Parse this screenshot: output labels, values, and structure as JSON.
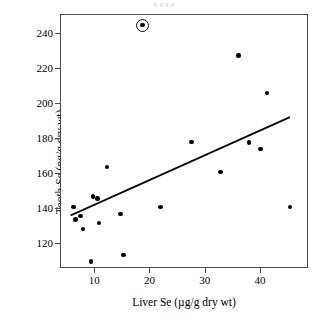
{
  "figure": {
    "top_caption_fragment": "p                          g       g  p",
    "background_color": "#ffffff",
    "frame_color": "#4a4a4a",
    "marker_color": "#000000",
    "line_color": "#000000"
  },
  "chart_data": {
    "type": "scatter",
    "title": "",
    "xlabel": "Liver Se (µg/g dry wt)",
    "ylabel": "Tooth Se (ng/g dry wt)",
    "xlim": [
      4.0,
      48.5
    ],
    "ylim": [
      106,
      250
    ],
    "xticks": [
      10,
      20,
      30,
      40
    ],
    "xtick_labels": [
      "10",
      "20",
      "30",
      "40"
    ],
    "yticks": [
      120,
      140,
      160,
      180,
      200,
      220,
      240
    ],
    "ytick_labels": [
      "120",
      "140",
      "160",
      "180",
      "200",
      "220",
      "240"
    ],
    "grid": false,
    "legend": null,
    "points": [
      {
        "x": 6.3,
        "y": 140.4
      },
      {
        "x": 6.6,
        "y": 133.3
      },
      {
        "x": 7.5,
        "y": 135.2
      },
      {
        "x": 8.0,
        "y": 127.8
      },
      {
        "x": 9.4,
        "y": 109.0
      },
      {
        "x": 9.8,
        "y": 146.2
      },
      {
        "x": 10.6,
        "y": 145.0
      },
      {
        "x": 10.9,
        "y": 131.2
      },
      {
        "x": 12.3,
        "y": 163.2
      },
      {
        "x": 14.8,
        "y": 136.3
      },
      {
        "x": 15.3,
        "y": 112.8
      },
      {
        "x": 18.7,
        "y": 244.2
      },
      {
        "x": 22.0,
        "y": 140.4
      },
      {
        "x": 27.6,
        "y": 177.5
      },
      {
        "x": 32.9,
        "y": 160.2
      },
      {
        "x": 36.1,
        "y": 226.7
      },
      {
        "x": 38.0,
        "y": 177.0
      },
      {
        "x": 40.1,
        "y": 173.5
      },
      {
        "x": 41.3,
        "y": 205.4
      },
      {
        "x": 45.4,
        "y": 140.3
      }
    ],
    "highlighted_points": [
      {
        "x": 18.7,
        "y": 244.2,
        "marker": "circled-outlier"
      }
    ],
    "trend_line": {
      "type": "linear-regression",
      "x_start": 5.9,
      "y_start": 134.8,
      "x_end": 45.6,
      "y_end": 191.0
    }
  }
}
